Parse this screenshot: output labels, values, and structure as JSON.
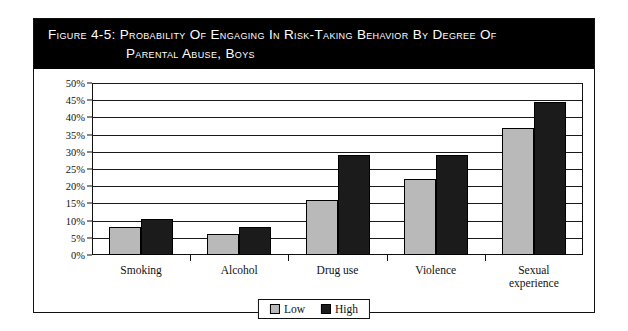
{
  "figure": {
    "title_line_1": "Figure 4-5:  Probability of Engaging in Risk-Taking Behavior by degree of",
    "title_line_2": "Parental Abuse, Boys"
  },
  "chart_data": {
    "type": "bar",
    "title": "Probability of Engaging in Risk-Taking Behavior by degree of Parental Abuse, Boys",
    "xlabel": "",
    "ylabel": "",
    "ylim": [
      0,
      50
    ],
    "ytick_labels": [
      "0%",
      "5%",
      "10%",
      "15%",
      "20%",
      "25%",
      "30%",
      "35%",
      "40%",
      "45%",
      "50%"
    ],
    "ytick_values": [
      0,
      5,
      10,
      15,
      20,
      25,
      30,
      35,
      40,
      45,
      50
    ],
    "grid": true,
    "legend_position": "bottom-center",
    "categories": [
      "Smoking",
      "Alcohol",
      "Drug use",
      "Violence",
      "Sexual\nexperience"
    ],
    "series": [
      {
        "name": "Low",
        "color": "#b9b9b9",
        "values": [
          8,
          6,
          16,
          22,
          37
        ]
      },
      {
        "name": "High",
        "color": "#1b1b1b",
        "values": [
          10.5,
          8,
          29,
          29,
          44.5
        ]
      }
    ]
  },
  "legend": {
    "entries": [
      {
        "label": "Low"
      },
      {
        "label": "High"
      }
    ]
  }
}
